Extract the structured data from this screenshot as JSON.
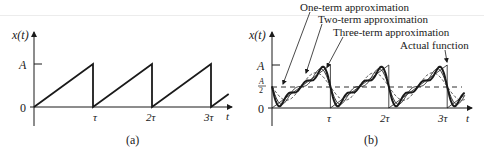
{
  "chart_data": [
    {
      "panel": "a",
      "type": "line",
      "title": "",
      "caption": "(a)",
      "ylabel": "x(t)",
      "xlabel": "t",
      "y_ticks": [
        "0",
        "A"
      ],
      "x_ticks": [
        "τ",
        "2τ",
        "3τ"
      ],
      "series": [
        {
          "name": "Sawtooth x(t)",
          "description": "Linear ramp from 0 to A over each period τ, dropping back to 0",
          "x": [
            0,
            1,
            1,
            2,
            2,
            3,
            3,
            3.3
          ],
          "y": [
            0,
            1,
            0,
            1,
            0,
            1,
            0,
            0.3
          ]
        }
      ],
      "xlim": [
        0,
        3.3
      ],
      "ylim": [
        0,
        1
      ],
      "units": {
        "x": "τ",
        "y": "A"
      }
    },
    {
      "panel": "b",
      "type": "line",
      "title": "",
      "caption": "(b)",
      "ylabel": "x(t)",
      "xlabel": "t",
      "y_ticks": [
        "0",
        "A/2",
        "A"
      ],
      "x_ticks": [
        "τ",
        "2τ",
        "3τ"
      ],
      "reference_line": {
        "y": 0.5,
        "style": "dashed",
        "label": "A/2"
      },
      "series": [
        {
          "name": "Actual function",
          "terms": 0,
          "style": "thin-solid"
        },
        {
          "name": "One-term approximation",
          "terms": 1,
          "style": "dashed"
        },
        {
          "name": "Two-term approximation",
          "terms": 2,
          "style": "thin-solid"
        },
        {
          "name": "Three-term approximation",
          "terms": 3,
          "style": "thick-solid"
        }
      ],
      "formula": "x(t) = A/2 - (A/π) Σ sin(2πnt/τ)/n",
      "annotations": [
        "One-term approximation",
        "Two-term approximation",
        "Three-term approximation",
        "Actual function"
      ],
      "xlim": [
        0,
        3.3
      ],
      "ylim": [
        0,
        1
      ],
      "units": {
        "x": "τ",
        "y": "A"
      }
    }
  ],
  "labels": {
    "a": {
      "ylabel": "x(t)",
      "A": "A",
      "zero": "0",
      "tau1": "τ",
      "tau2": "2τ",
      "tau3": "3τ",
      "t": "t",
      "caption": "(a)"
    },
    "b": {
      "ylabel": "x(t)",
      "A": "A",
      "half_num": "A",
      "half_den": "2",
      "zero": "0",
      "tau1": "τ",
      "tau2": "2τ",
      "tau3": "3τ",
      "t": "t",
      "caption": "(b)",
      "ann1": "One-term approximation",
      "ann2": "Two-term approximation",
      "ann3": "Three-term approximation",
      "ann4": "Actual function"
    }
  },
  "colors": {
    "ink": "#1a1a1a",
    "background": "#ffffff"
  }
}
